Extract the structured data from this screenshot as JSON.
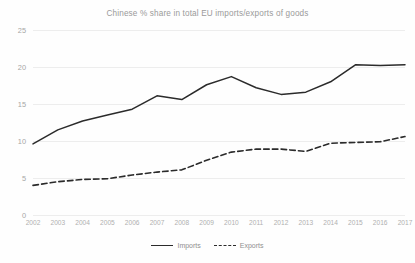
{
  "chart_data": {
    "type": "line",
    "title": "Chinese % share in total EU imports/exports of goods",
    "xlabel": "",
    "ylabel": "",
    "ylim": [
      0,
      25
    ],
    "yticks": [
      0,
      5,
      10,
      15,
      20,
      25
    ],
    "grid": true,
    "legend_position": "bottom",
    "categories": [
      "2002",
      "2003",
      "2004",
      "2005",
      "2006",
      "2007",
      "2008",
      "2009",
      "2010",
      "2011",
      "2012",
      "2013",
      "2014",
      "2015",
      "2016",
      "2017"
    ],
    "series": [
      {
        "name": "Imports",
        "style": "solid",
        "color": "#2b2b2b",
        "values": [
          9.6,
          11.5,
          12.7,
          13.5,
          14.3,
          16.1,
          15.6,
          17.6,
          18.7,
          17.2,
          16.3,
          16.6,
          18.0,
          20.3,
          20.2,
          20.3
        ]
      },
      {
        "name": "Exports",
        "style": "dashed",
        "color": "#2b2b2b",
        "values": [
          4.0,
          4.5,
          4.8,
          4.9,
          5.4,
          5.8,
          6.1,
          7.4,
          8.5,
          8.9,
          8.9,
          8.6,
          9.7,
          9.8,
          9.9,
          10.6
        ]
      }
    ]
  },
  "legend": {
    "items": [
      {
        "label": "Imports",
        "style": "solid"
      },
      {
        "label": "Exports",
        "style": "dashed"
      }
    ]
  }
}
